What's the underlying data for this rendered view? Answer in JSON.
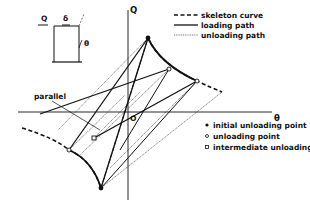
{
  "diagram": {
    "type": "hysteresis-model",
    "axes": {
      "y_label": "Q",
      "x_label": "θ",
      "origin_label": "O"
    },
    "inset": {
      "force_label": "Q",
      "displacement_label": "δ",
      "rotation_label": "θ"
    },
    "annotation": {
      "parallel_label": "parallel"
    },
    "legend_lines": [
      {
        "style": "dashed",
        "label": "skeleton curve"
      },
      {
        "style": "solid",
        "label": "loading path"
      },
      {
        "style": "dotted",
        "label": "unloading path"
      }
    ],
    "legend_markers": [
      {
        "marker": "filled-circle",
        "label": "initial unloading point"
      },
      {
        "marker": "open-circle",
        "label": "unloading point"
      },
      {
        "marker": "open-square",
        "label": "intermediate unloading point"
      }
    ],
    "colors": {
      "ink": "#111111",
      "background": "#ffffff"
    }
  }
}
